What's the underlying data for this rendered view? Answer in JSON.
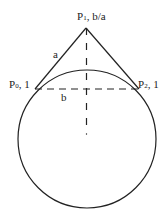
{
  "diagram": {
    "labels": {
      "p1": {
        "main": "P",
        "sub": "1",
        "rest": ", b/a"
      },
      "p0": {
        "main": "P",
        "sub": "0",
        "rest": ", 1"
      },
      "p2": {
        "main": "P",
        "sub": "2",
        "rest": ", 1"
      },
      "a": "a",
      "b": "b"
    },
    "colors": {
      "stroke": "#222222",
      "background": "#ffffff"
    }
  }
}
